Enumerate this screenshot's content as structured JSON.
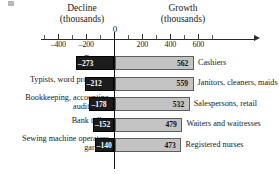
{
  "headers": {
    "left": "Decline\n(thousands)",
    "left_line1": "Decline",
    "left_line2": "(thousands)",
    "right_line1": "Growth",
    "right_line2": "(thousands)"
  },
  "axis": {
    "zero_label": "0",
    "major_ticks": [
      {
        "value": -400,
        "label": "–400"
      },
      {
        "value": -200,
        "label": "–200"
      },
      {
        "value": 200,
        "label": "200"
      },
      {
        "value": 400,
        "label": "400"
      },
      {
        "value": 600,
        "label": "600"
      }
    ],
    "minor_ticks": [
      -500,
      -300,
      -100,
      100,
      300,
      500,
      700
    ]
  },
  "chart_data": {
    "type": "bar",
    "title": "",
    "subtitle": "",
    "xlabel": "",
    "ylabel": "",
    "xlim": [
      -500,
      750
    ],
    "grid": false,
    "orientation": "horizontal",
    "legend_position": "top",
    "legend": [
      "Decline (thousands)",
      "Growth (thousands)"
    ],
    "categories": [
      "Farmers",
      "Typists, word processors",
      "Bookkeeping, accounting, audit clerks",
      "Bank tellers",
      "Sewing machine operators, garment"
    ],
    "categories_right": [
      "Cashiers",
      "Janitors, cleaners, maids",
      "Salespersons, retail",
      "Waiters and waitresses",
      "Registered nurses"
    ],
    "series": [
      {
        "name": "Decline (thousands)",
        "color": "#1c1c1c",
        "values": [
          -273,
          -212,
          -178,
          -152,
          -140
        ],
        "labels": [
          "–273",
          "–212",
          "–178",
          "–152",
          "–140"
        ]
      },
      {
        "name": "Growth (thousands)",
        "color": "#c3c3c3",
        "values": [
          562,
          559,
          532,
          479,
          473
        ],
        "labels": [
          "562",
          "559",
          "532",
          "479",
          "473"
        ]
      }
    ]
  },
  "rows": [
    {
      "left_label_lines": [
        "Farmers"
      ],
      "right_label": "Cashiers",
      "neg": -273,
      "neg_label": "–273",
      "pos": 562,
      "pos_label": "562"
    },
    {
      "left_label_lines": [
        "Typists, word processors"
      ],
      "right_label": "Janitors, cleaners, maids",
      "neg": -212,
      "neg_label": "–212",
      "pos": 559,
      "pos_label": "559"
    },
    {
      "left_label_lines": [
        "Bookkeeping, accounting,",
        "audit clerks"
      ],
      "right_label": "Salespersons, retail",
      "neg": -178,
      "neg_label": "–178",
      "pos": 532,
      "pos_label": "532"
    },
    {
      "left_label_lines": [
        "Bank tellers"
      ],
      "right_label": "Waiters and waitresses",
      "neg": -152,
      "neg_label": "–152",
      "pos": 479,
      "pos_label": "479"
    },
    {
      "left_label_lines": [
        "Sewing machine operators,",
        "garment"
      ],
      "right_label": "Registered nurses",
      "neg": -140,
      "neg_label": "–140",
      "pos": 473,
      "pos_label": "473"
    }
  ],
  "colors": {
    "decline_bar": "#1c1c1c",
    "growth_bar": "#c3c3c3",
    "axis": "#2b2b2b",
    "zero_axis": "#111111",
    "text": "#1a1a1a"
  }
}
